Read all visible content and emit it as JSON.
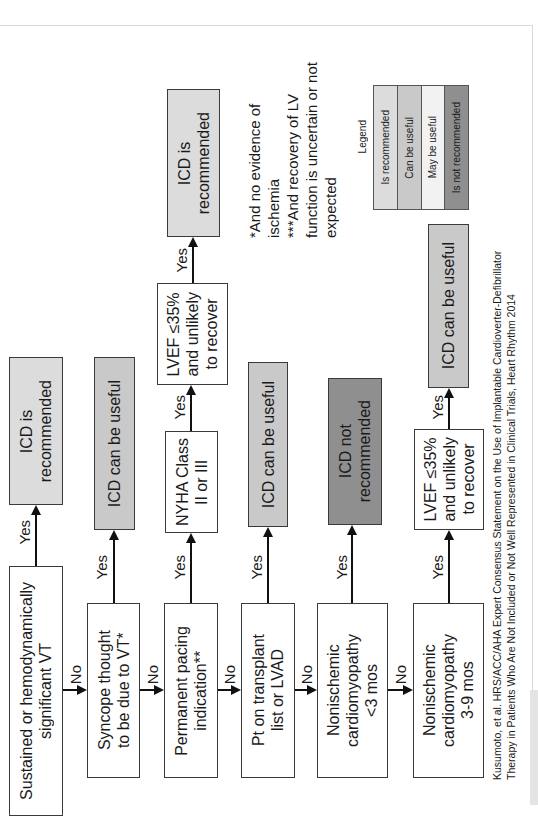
{
  "legend": {
    "title": "Legend",
    "items": [
      {
        "label": "Is recommended",
        "color": "#dcdcdc"
      },
      {
        "label": "Can be useful",
        "color": "#c9c9c9"
      },
      {
        "label": "May be useful",
        "color": "#f2f2f2"
      },
      {
        "label": "Is not recommended",
        "color": "#8f8f8f"
      }
    ]
  },
  "decisions": [
    {
      "text": "Sustained or hemodynamically\nsignificant VT"
    },
    {
      "text": "Syncope thought\nto be due to VT*"
    },
    {
      "text": "Permanent pacing\nindication**"
    },
    {
      "text": "Pt on transplant\nlist or LVAD"
    },
    {
      "text": "Nonischemic\ncardiomyopathy\n<3 mos"
    },
    {
      "text": "Nonischemic\ncardiomyopathy\n3-9 mos"
    }
  ],
  "intermediate": [
    {
      "text": "NYHA Class\nII or III"
    },
    {
      "text": "LVEF ≤35%\nand unlikely\nto recover"
    },
    {
      "text": "LVEF ≤35%\nand unlikely\nto recover"
    }
  ],
  "outcomes": [
    {
      "text": "ICD is\nrecommended",
      "level": "Is recommended"
    },
    {
      "text": "ICD can be useful",
      "level": "Can be useful"
    },
    {
      "text": "ICD is\nrecommended",
      "level": "Is recommended"
    },
    {
      "text": "ICD can be useful",
      "level": "Can be useful"
    },
    {
      "text": "ICD not\nrecommended",
      "level": "Is not recommended"
    },
    {
      "text": "ICD can be useful",
      "level": "Can be useful"
    }
  ],
  "edge_labels": {
    "yes": "Yes",
    "no": "No"
  },
  "footnotes": "*And no evidence of\nischemia\n***And recovery of LV\nfunction is uncertain or not\nexpected",
  "citation": "Kusumoto, et al. HRS/ACC/AHA Expert Consensus Statement on the Use of Implantable Cardioverter-Defibrillator\nTherapy in Patients Who Are Not Included or Not Well Represented in Clinical Trials, Heart Rhythm 2014"
}
